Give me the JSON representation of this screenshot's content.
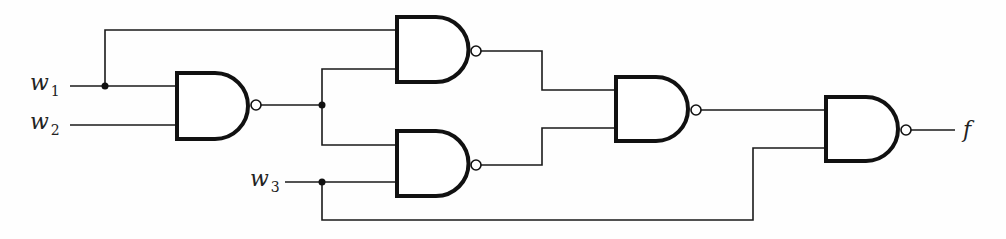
{
  "diagram": {
    "type": "logic-circuit",
    "gate_type": "NAND",
    "inputs": [
      {
        "name": "w",
        "sub": "1"
      },
      {
        "name": "w",
        "sub": "2"
      },
      {
        "name": "w",
        "sub": "3"
      }
    ],
    "output": {
      "name": "f"
    },
    "gates": [
      {
        "id": "G1",
        "type": "NAND",
        "inputs": [
          "w1",
          "w2"
        ]
      },
      {
        "id": "G2",
        "type": "NAND",
        "inputs": [
          "w1",
          "G1"
        ]
      },
      {
        "id": "G3",
        "type": "NAND",
        "inputs": [
          "G1",
          "w3"
        ]
      },
      {
        "id": "G4",
        "type": "NAND",
        "inputs": [
          "G2",
          "G3"
        ]
      },
      {
        "id": "G5",
        "type": "NAND",
        "inputs": [
          "G4",
          "w3"
        ]
      }
    ],
    "colors": {
      "ink": "#111111",
      "background": "#ffffff"
    }
  }
}
